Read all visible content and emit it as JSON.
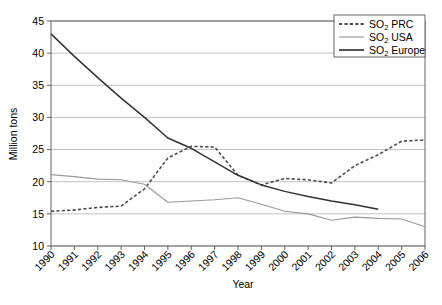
{
  "chart_data": {
    "type": "line",
    "title": "",
    "xlabel": "Year",
    "ylabel": "Million tons",
    "x": [
      1990,
      1991,
      1992,
      1993,
      1994,
      1995,
      1996,
      1997,
      1998,
      1999,
      2000,
      2001,
      2002,
      2003,
      2004,
      2005,
      2006
    ],
    "categories": [
      "1990",
      "1991",
      "1992",
      "1993",
      "1994",
      "1995",
      "1996",
      "1997",
      "1998",
      "1999",
      "2000",
      "2001",
      "2002",
      "2003",
      "2004",
      "2005",
      "2006"
    ],
    "xlim": [
      1990,
      2006
    ],
    "ylim": [
      10,
      45
    ],
    "yticks": [
      10,
      15,
      20,
      25,
      30,
      35,
      40,
      45
    ],
    "ytick_labels": [
      "10",
      "15",
      "20",
      "25",
      "30",
      "35",
      "40",
      "45"
    ],
    "grid": true,
    "grid_axis": "y",
    "legend_position": "top-right",
    "series": [
      {
        "name": "SO2 PRC",
        "label_main": "SO",
        "label_sub": "2",
        "label_rest": " PRC",
        "style": "dashed",
        "color": "#4d4d4d",
        "values": [
          15.4,
          15.6,
          16.0,
          16.2,
          18.9,
          23.7,
          25.5,
          25.4,
          21.0,
          19.5,
          20.5,
          20.3,
          19.8,
          22.5,
          24.2,
          26.3,
          26.5
        ]
      },
      {
        "name": "SO2 USA",
        "label_main": "SO",
        "label_sub": "2",
        "label_rest": " USA",
        "style": "solid-light",
        "color": "#9a9a9a",
        "values": [
          21.1,
          20.8,
          20.4,
          20.3,
          19.6,
          16.8,
          17.0,
          17.2,
          17.5,
          16.5,
          15.4,
          15.0,
          14.0,
          14.5,
          14.3,
          14.2,
          13.0
        ]
      },
      {
        "name": "SO2 Europe",
        "label_main": "SO",
        "label_sub": "2",
        "label_rest": " Europe",
        "style": "solid-dark",
        "color": "#333333",
        "values": [
          43.0,
          39.5,
          36.2,
          33.0,
          30.0,
          26.8,
          25.2,
          23.1,
          21.0,
          19.5,
          18.5,
          17.7,
          17.0,
          16.4,
          15.7,
          null,
          null
        ]
      }
    ]
  },
  "legend": {
    "entries": [
      {
        "main": "SO",
        "sub": "2",
        "rest": " PRC"
      },
      {
        "main": "SO",
        "sub": "2",
        "rest": " USA"
      },
      {
        "main": "SO",
        "sub": "2",
        "rest": " Europe"
      }
    ]
  },
  "axes": {
    "y_title": "Million tons",
    "x_title": "Year"
  }
}
